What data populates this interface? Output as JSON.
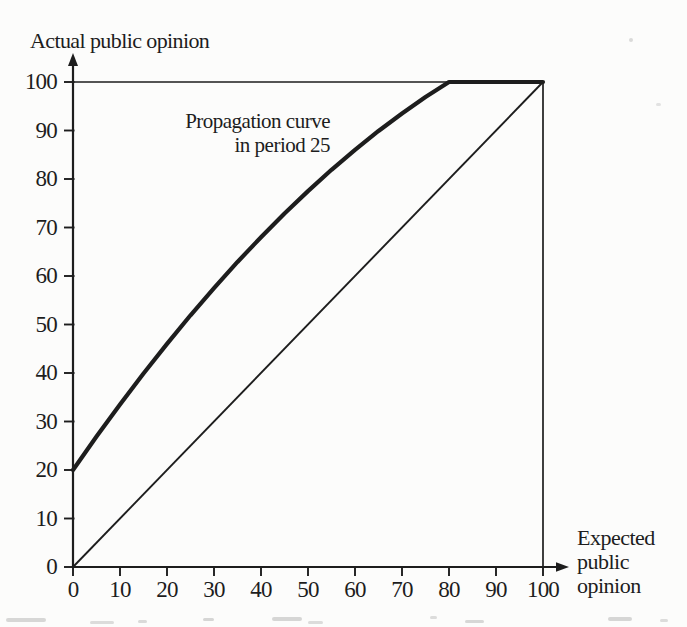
{
  "figure": {
    "y_axis_title": "Actual public opinion",
    "x_axis_title_lines": [
      "Expected",
      "public",
      "opinion"
    ],
    "annotation": {
      "line1": "Propagation curve",
      "line2": "in period 25"
    }
  },
  "chart_data": {
    "type": "line",
    "title": "",
    "xlabel": "Expected public opinion",
    "ylabel": "Actual public opinion",
    "xlim": [
      0,
      100
    ],
    "ylim": [
      0,
      100
    ],
    "x_ticks": [
      0,
      10,
      20,
      30,
      40,
      50,
      60,
      70,
      80,
      90,
      100
    ],
    "y_ticks": [
      0,
      10,
      20,
      30,
      40,
      50,
      60,
      70,
      80,
      90,
      100
    ],
    "grid": false,
    "legend": "none",
    "annotation_text": "Propagation curve in period 25",
    "series": [
      {
        "name": "diagonal-45-degree-reference-line",
        "weight": "thin",
        "x": [
          0,
          100
        ],
        "y": [
          0,
          100
        ]
      },
      {
        "name": "propagation-curve-period-25",
        "weight": "thick",
        "x": [
          0,
          5,
          10,
          15,
          20,
          25,
          30,
          35,
          40,
          45,
          50,
          55,
          60,
          65,
          70,
          75,
          80,
          100
        ],
        "y": [
          20,
          26.9,
          33.5,
          39.9,
          46,
          51.9,
          57.5,
          62.9,
          68,
          72.9,
          77.5,
          81.9,
          86,
          89.9,
          93.5,
          96.9,
          100,
          100
        ]
      }
    ],
    "colors": {
      "ink": "#1d1d1d",
      "background": "#fcfcfb"
    }
  }
}
